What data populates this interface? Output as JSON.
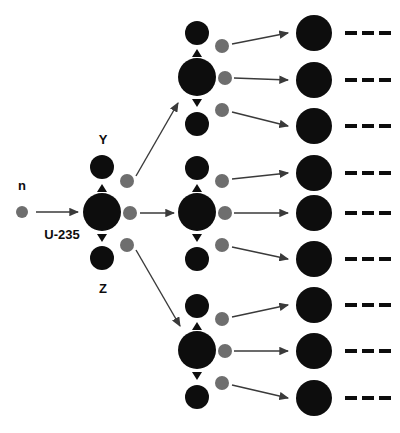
{
  "diagram": {
    "type": "diagram",
    "width": 400,
    "height": 433,
    "background_color": "#ffffff",
    "colors": {
      "nucleus": "#0d0d0d",
      "fragment": "#0d0d0d",
      "neutron": "#6e6e6e",
      "arrow": "#3a3a3a",
      "dash": "#0d0d0d",
      "text": "#0d0d0d"
    },
    "labels": [
      {
        "name": "incident-neutron-label",
        "text": "n",
        "x": 22,
        "y": 187
      },
      {
        "name": "uranium-label",
        "text": "U-235",
        "x": 62,
        "y": 236
      },
      {
        "name": "fragment-y-label",
        "text": "Y",
        "x": 103,
        "y": 141
      },
      {
        "name": "fragment-z-label",
        "text": "Z",
        "x": 103,
        "y": 290
      }
    ],
    "incident_neutron": {
      "cx": 22,
      "cy": 212,
      "r": 6
    },
    "incident_arrow": {
      "x1": 36,
      "y1": 212,
      "x2": 78,
      "y2": 212
    },
    "generation1": {
      "nucleus": {
        "cx": 102,
        "cy": 212,
        "r": 19
      },
      "fragment_top": {
        "cx": 102,
        "cy": 167,
        "r": 12
      },
      "fragment_bottom": {
        "cx": 102,
        "cy": 258,
        "r": 12
      },
      "tick_up": {
        "cx": 102,
        "cy": 188
      },
      "tick_down": {
        "cx": 102,
        "cy": 238
      },
      "neutrons": [
        {
          "cx": 127,
          "cy": 181,
          "r": 7
        },
        {
          "cx": 130,
          "cy": 213,
          "r": 7
        },
        {
          "cx": 127,
          "cy": 245,
          "r": 7
        }
      ]
    },
    "generation2": [
      {
        "name": "fission-node-top",
        "nucleus": {
          "cx": 197,
          "cy": 77,
          "r": 19
        },
        "fragment_top": {
          "cx": 197,
          "cy": 33,
          "r": 12
        },
        "fragment_bottom": {
          "cx": 197,
          "cy": 124,
          "r": 12
        },
        "tick_up": {
          "cx": 197,
          "cy": 53
        },
        "tick_down": {
          "cx": 197,
          "cy": 103
        },
        "neutrons": [
          {
            "cx": 222,
            "cy": 46,
            "r": 7
          },
          {
            "cx": 225,
            "cy": 78,
            "r": 7
          },
          {
            "cx": 222,
            "cy": 110,
            "r": 7
          }
        ]
      },
      {
        "name": "fission-node-middle",
        "nucleus": {
          "cx": 197,
          "cy": 212,
          "r": 19
        },
        "fragment_top": {
          "cx": 197,
          "cy": 168,
          "r": 12
        },
        "fragment_bottom": {
          "cx": 197,
          "cy": 259,
          "r": 12
        },
        "tick_up": {
          "cx": 197,
          "cy": 188
        },
        "tick_down": {
          "cx": 197,
          "cy": 238
        },
        "neutrons": [
          {
            "cx": 222,
            "cy": 181,
            "r": 7
          },
          {
            "cx": 225,
            "cy": 213,
            "r": 7
          },
          {
            "cx": 222,
            "cy": 245,
            "r": 7
          }
        ]
      },
      {
        "name": "fission-node-bottom",
        "nucleus": {
          "cx": 197,
          "cy": 350,
          "r": 19
        },
        "fragment_top": {
          "cx": 197,
          "cy": 306,
          "r": 12
        },
        "fragment_bottom": {
          "cx": 197,
          "cy": 397,
          "r": 12
        },
        "tick_up": {
          "cx": 197,
          "cy": 326
        },
        "tick_down": {
          "cx": 197,
          "cy": 376
        },
        "neutrons": [
          {
            "cx": 222,
            "cy": 319,
            "r": 7
          },
          {
            "cx": 225,
            "cy": 351,
            "r": 7
          },
          {
            "cx": 222,
            "cy": 383,
            "r": 7
          }
        ]
      }
    ],
    "generation1_arrows": [
      {
        "name": "arrow-to-top-node",
        "x1": 136,
        "y1": 176,
        "x2": 178,
        "y2": 103
      },
      {
        "name": "arrow-to-middle-node",
        "x1": 140,
        "y1": 213,
        "x2": 174,
        "y2": 213
      },
      {
        "name": "arrow-to-bottom-node",
        "x1": 136,
        "y1": 250,
        "x2": 180,
        "y2": 326
      }
    ],
    "generation2_arrows": [
      {
        "name": "arrow-top-to-product-1",
        "x1": 232,
        "y1": 44,
        "x2": 288,
        "y2": 33
      },
      {
        "name": "arrow-top-to-product-2",
        "x1": 234,
        "y1": 78,
        "x2": 288,
        "y2": 80
      },
      {
        "name": "arrow-top-to-product-3",
        "x1": 232,
        "y1": 112,
        "x2": 288,
        "y2": 126
      },
      {
        "name": "arrow-middle-to-product-4",
        "x1": 232,
        "y1": 179,
        "x2": 288,
        "y2": 173
      },
      {
        "name": "arrow-middle-to-product-5",
        "x1": 234,
        "y1": 213,
        "x2": 288,
        "y2": 213
      },
      {
        "name": "arrow-middle-to-product-6",
        "x1": 232,
        "y1": 247,
        "x2": 288,
        "y2": 259
      },
      {
        "name": "arrow-bottom-to-product-7",
        "x1": 232,
        "y1": 317,
        "x2": 288,
        "y2": 305
      },
      {
        "name": "arrow-bottom-to-product-8",
        "x1": 234,
        "y1": 351,
        "x2": 288,
        "y2": 351
      },
      {
        "name": "arrow-bottom-to-product-9",
        "x1": 232,
        "y1": 385,
        "x2": 288,
        "y2": 398
      }
    ],
    "generation3_products": [
      {
        "name": "product-nucleus-1",
        "cx": 314,
        "cy": 33,
        "r": 18,
        "dash_y": 33
      },
      {
        "name": "product-nucleus-2",
        "cx": 314,
        "cy": 80,
        "r": 18,
        "dash_y": 80
      },
      {
        "name": "product-nucleus-3",
        "cx": 314,
        "cy": 126,
        "r": 18,
        "dash_y": 126
      },
      {
        "name": "product-nucleus-4",
        "cx": 314,
        "cy": 173,
        "r": 18,
        "dash_y": 173
      },
      {
        "name": "product-nucleus-5",
        "cx": 314,
        "cy": 213,
        "r": 18,
        "dash_y": 213
      },
      {
        "name": "product-nucleus-6",
        "cx": 314,
        "cy": 259,
        "r": 18,
        "dash_y": 259
      },
      {
        "name": "product-nucleus-7",
        "cx": 314,
        "cy": 305,
        "r": 18,
        "dash_y": 305
      },
      {
        "name": "product-nucleus-8",
        "cx": 314,
        "cy": 351,
        "r": 18,
        "dash_y": 351
      },
      {
        "name": "product-nucleus-9",
        "cx": 314,
        "cy": 398,
        "r": 18,
        "dash_y": 398
      }
    ],
    "dash_marks": {
      "count": 3,
      "start_x": 345,
      "spacing": 17,
      "width": 12,
      "height": 4
    }
  }
}
